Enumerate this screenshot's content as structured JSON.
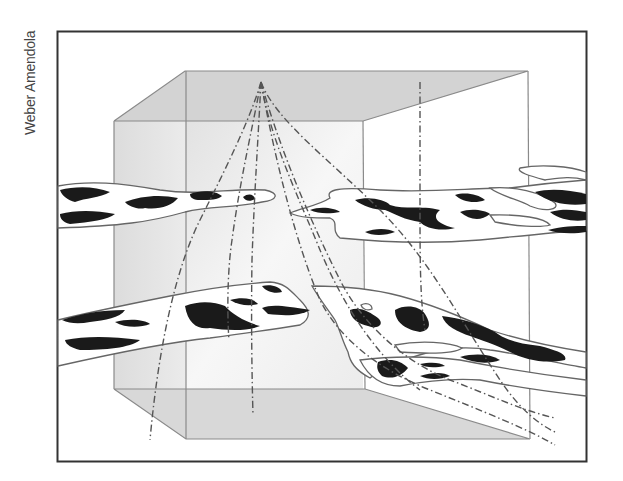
{
  "figure": {
    "credit": "Weber Amendola",
    "colors": {
      "frame": "#333333",
      "box_edge": "#8a8a8a",
      "box_face_top": "#d4d4d4",
      "box_face_back": "#efefef",
      "box_face_bottom": "#d9d9d9",
      "channel_outline": "#6a6a6a",
      "channel_fill": "#ffffff",
      "sand_body": "#1a1a1a",
      "well_path": "#555555"
    },
    "elements": {
      "frame": {
        "x": 57,
        "y": 31,
        "w": 530,
        "h": 431
      },
      "block": {
        "top_back_left": [
          185,
          71
        ],
        "top_back_right": [
          528,
          71
        ],
        "top_front_left": [
          114,
          121
        ],
        "top_front_right": [
          363,
          121
        ],
        "bottom_front_left": [
          114,
          389
        ],
        "bottom_front_right": [
          365,
          389
        ],
        "bottom_back_left": [
          186,
          439
        ],
        "bottom_back_right": [
          530,
          439
        ]
      },
      "wellhead": [
        261,
        82
      ],
      "well_count": 8,
      "channel_layers": 2
    }
  }
}
